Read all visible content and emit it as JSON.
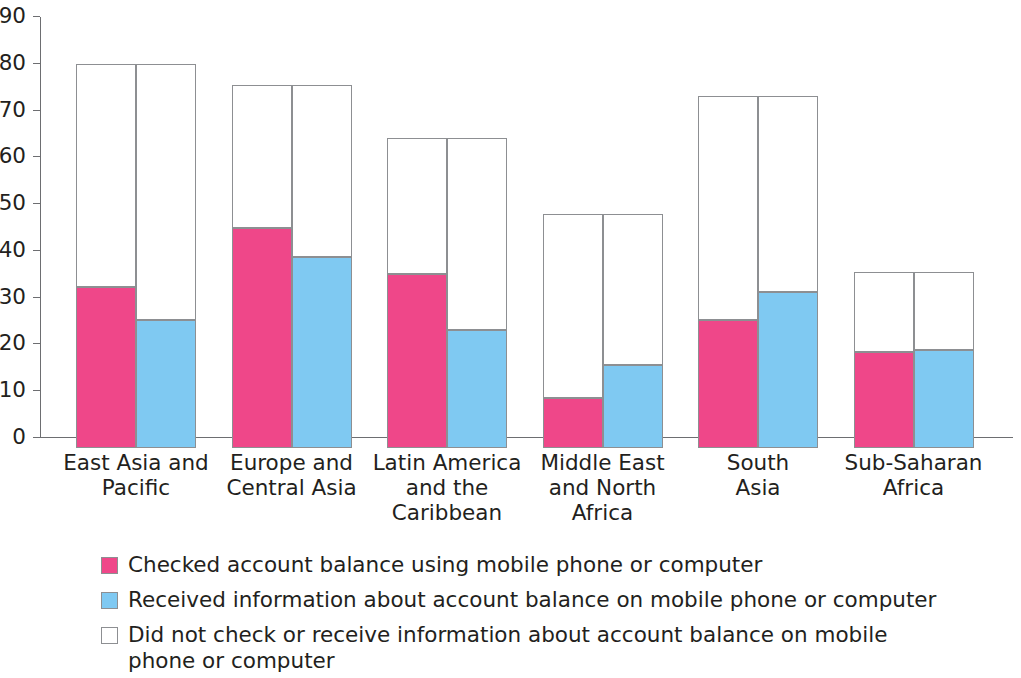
{
  "chart_data": {
    "type": "bar",
    "subtype": "grouped-stacked",
    "title": "",
    "xlabel": "",
    "ylabel": "",
    "ylim": [
      0,
      90
    ],
    "ytick_step": 10,
    "yticks": [
      0,
      10,
      20,
      30,
      40,
      50,
      60,
      70,
      80,
      90
    ],
    "grid": false,
    "legend_position": "bottom-left",
    "categories": [
      "East Asia and Pacific",
      "Europe and Central Asia",
      "Latin America and the Caribbean",
      "Middle East and North Africa",
      "South Asia",
      "Sub-Saharan Africa"
    ],
    "category_lines": [
      [
        "East Asia and",
        "Pacific"
      ],
      [
        "Europe and",
        "Central Asia"
      ],
      [
        "Latin America",
        "and the",
        "Caribbean"
      ],
      [
        "Middle East",
        "and North",
        "Africa"
      ],
      [
        "South",
        "Asia"
      ],
      [
        "Sub-Saharan",
        "Africa"
      ]
    ],
    "series": [
      {
        "name": "Checked account balance using mobile phone or computer",
        "color": "#ef4789",
        "values": [
          34.5,
          47.0,
          37.3,
          10.6,
          27.4,
          20.5
        ]
      },
      {
        "name": "Received information about account balance on mobile phone or computer",
        "color": "#7fc9f2",
        "values": [
          27.4,
          40.8,
          25.2,
          17.8,
          33.4,
          21.0
        ]
      },
      {
        "name": "Did not check or receive information about account balance on mobile phone or computer",
        "color": "#ffffff",
        "values_checked_column": [
          47.6,
          30.5,
          29.0,
          39.4,
          47.8,
          17.2
        ],
        "values_received_column": [
          54.7,
          36.7,
          41.1,
          32.2,
          41.8,
          16.7
        ]
      }
    ],
    "group_totals": [
      82.1,
      77.5,
      66.3,
      50.0,
      75.2,
      37.7
    ],
    "units": "percent of adults"
  },
  "axis": {
    "y_tick_labels": [
      "90",
      "80",
      "70",
      "60",
      "50",
      "40",
      "30",
      "20",
      "10",
      "0"
    ]
  },
  "legend": {
    "items": [
      {
        "swatch": "pink-swatch",
        "color": "#ef4789",
        "label": "Checked account balance using mobile phone or computer"
      },
      {
        "swatch": "blue-swatch",
        "color": "#7fc9f2",
        "label": "Received information about account balance on mobile phone or computer"
      },
      {
        "swatch": "white-swatch",
        "color": "#ffffff",
        "label": "Did not check or receive information about account balance on mobile phone or computer"
      }
    ]
  }
}
